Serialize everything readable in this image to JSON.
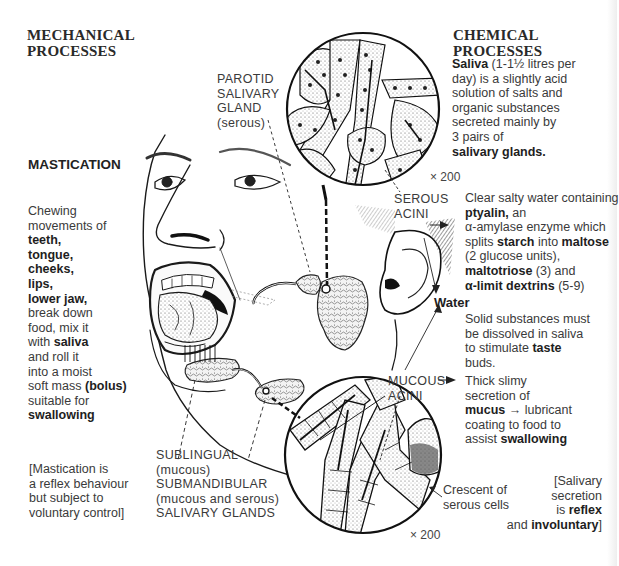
{
  "headings": {
    "mechanical": [
      "MECHANICAL",
      "PROCESSES"
    ],
    "chemical": [
      "CHEMICAL",
      "PROCESSES"
    ],
    "mastication": "MASTICATION"
  },
  "saliva_intro": {
    "lines": [
      {
        "bold": "Saliva",
        "text": " (1-1½ litres per"
      },
      {
        "text": "day) is a slightly acid"
      },
      {
        "text": "solution of salts and"
      },
      {
        "text": "organic substances"
      },
      {
        "text": "secreted mainly by"
      },
      {
        "text": "3 pairs of"
      },
      {
        "bold": "salivary glands."
      }
    ]
  },
  "mastication_text": {
    "lines": [
      {
        "text": "Chewing"
      },
      {
        "text": "movements of"
      },
      {
        "bold": "teeth,"
      },
      {
        "bold": "tongue,"
      },
      {
        "bold": "cheeks,"
      },
      {
        "bold": "lips,"
      },
      {
        "bold": "lower jaw,"
      },
      {
        "text": "break down"
      },
      {
        "text": "food, mix it"
      },
      {
        "text": "with ",
        "bold2": "saliva"
      },
      {
        "text": "and roll it"
      },
      {
        "text": "into a moist"
      },
      {
        "text": "soft mass ",
        "bold2": "(bolus)"
      },
      {
        "text": "suitable for"
      },
      {
        "bold": "swallowing"
      }
    ]
  },
  "mastication_note": [
    "[Mastication is",
    "a reflex behaviour",
    "but subject to",
    "voluntary control]"
  ],
  "parotid_label": [
    "PAROTID",
    "SALIVARY",
    "GLAND",
    "(serous)"
  ],
  "serous_label": [
    "SEROUS",
    "ACINI"
  ],
  "mucous_label": [
    "MUCOUS",
    "ACINI"
  ],
  "magnification_top": "× 200",
  "magnification_bottom": "× 200",
  "serous_text": {
    "lines": [
      {
        "text": "Clear salty water containing"
      },
      {
        "bold": "ptyalin,",
        "text2": " an"
      },
      {
        "text": "α-amylase enzyme which"
      },
      {
        "text": "splits ",
        "bold2": "starch",
        "text3": " into ",
        "bold3": "maltose"
      },
      {
        "text": "(2 glucose units),"
      },
      {
        "bold": "maltotriose",
        "text2": " (3) and"
      },
      {
        "bold": "α-limit dextrins",
        "text2": " (5-9)"
      }
    ]
  },
  "water_label": "Water",
  "water_text": [
    "Solid substances must",
    "be dissolved in saliva",
    "to stimulate ",
    "taste",
    "buds."
  ],
  "mucous_text": {
    "lines": [
      {
        "text": "Thick slimy"
      },
      {
        "text": "secretion of"
      },
      {
        "bold": "mucus",
        "text2": " → lubricant"
      },
      {
        "text": "coating to food to"
      },
      {
        "text": "assist ",
        "bold2": "swallowing"
      }
    ]
  },
  "crescent_label": [
    "Crescent of",
    "serous cells"
  ],
  "reflex_note": {
    "l1": "[Salivary",
    "l2": "secretion",
    "l3a": "is ",
    "l3b": "reflex",
    "l4a": "and ",
    "l4b": "involuntary",
    "l4c": "]"
  },
  "sub_labels": [
    "SUBLINGUAL",
    "(mucous)",
    "SUBMANDIBULAR",
    "(mucous and serous)",
    "SALIVARY GLANDS"
  ]
}
